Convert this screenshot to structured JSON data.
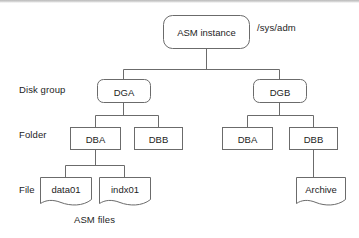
{
  "diagram": {
    "caption": "ASM files",
    "path_annotation": "/sys/adm",
    "stroke_color": "#6b6b6b",
    "text_color": "#1d1d1d",
    "background_color": "#ffffff",
    "row_labels": [
      {
        "key": "disk_group",
        "label": "Disk group"
      },
      {
        "key": "folder",
        "label": "Folder"
      },
      {
        "key": "file",
        "label": "File"
      }
    ],
    "nodes": {
      "instance": {
        "label": "ASM instance",
        "shape": "rounded-rect"
      },
      "diskgroup_a": {
        "label": "DGA",
        "shape": "rounded-rect"
      },
      "diskgroup_b": {
        "label": "DGB",
        "shape": "rounded-rect"
      },
      "folder_a_left": {
        "label": "DBA",
        "shape": "rect"
      },
      "folder_b_left": {
        "label": "DBB",
        "shape": "rect"
      },
      "folder_a_right": {
        "label": "DBA",
        "shape": "rect"
      },
      "folder_b_right": {
        "label": "DBB",
        "shape": "rect"
      },
      "file_data01": {
        "label": "data01",
        "shape": "document"
      },
      "file_indx01": {
        "label": "indx01",
        "shape": "document"
      },
      "file_archive": {
        "label": "Archive",
        "shape": "document"
      }
    }
  }
}
